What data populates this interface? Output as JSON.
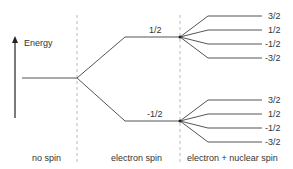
{
  "diagram": {
    "axis_label": "Energy",
    "columns": [
      {
        "label": "no spin"
      },
      {
        "label": "electron spin"
      },
      {
        "label": "electron + nuclear spin"
      }
    ],
    "electron_levels": [
      {
        "label": "1/2"
      },
      {
        "label": "-1/2"
      }
    ],
    "nuclear_levels_upper": [
      {
        "label": "3/2"
      },
      {
        "label": "1/2"
      },
      {
        "label": "-1/2"
      },
      {
        "label": "-3/2"
      }
    ],
    "nuclear_levels_lower": [
      {
        "label": "3/2"
      },
      {
        "label": "1/2"
      },
      {
        "label": "-1/2"
      },
      {
        "label": "-3/2"
      }
    ],
    "colors": {
      "line": "#555555",
      "divider": "#aaaaaa",
      "text": "#333333"
    }
  }
}
